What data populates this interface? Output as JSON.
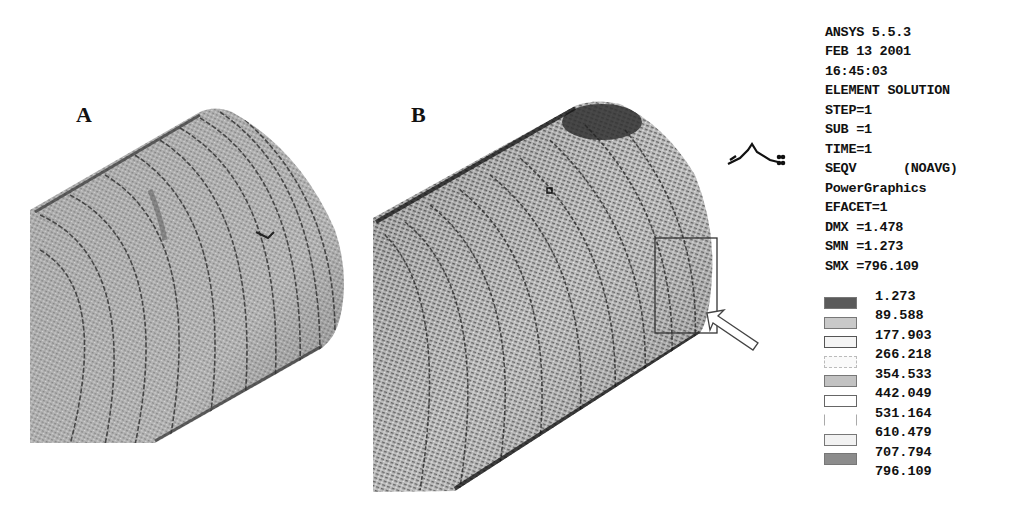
{
  "figure": {
    "panels": [
      {
        "label": "A",
        "description": "cylinder contour plot, uniform stress"
      },
      {
        "label": "B",
        "description": "cylinder contour plot with highlighted region and arrow"
      }
    ]
  },
  "legend": {
    "header_lines": [
      "ANSYS 5.5.3",
      "FEB 13 2001",
      "16:45:03",
      "ELEMENT SOLUTION",
      "STEP=1",
      "SUB =1",
      "TIME=1",
      "SEQV      (NOAVG)",
      "PowerGraphics",
      "EFACET=1",
      "DMX =1.478",
      "SMN =1.273",
      "SMX =796.109"
    ],
    "scale_values": [
      "1.273",
      "89.588",
      "177.903",
      "266.218",
      "354.533",
      "442.049",
      "531.164",
      "610.479",
      "707.794",
      "796.109"
    ],
    "swatch_colors": [
      "#5a5a5a",
      "#c9c9c9",
      "#f4f4f4",
      "#fafafa",
      "#c2c2c2",
      "#ffffff",
      "#ffffff",
      "#f2f2f2",
      "#8c8c8c"
    ]
  },
  "colors": {
    "background": "#ffffff",
    "mesh_fill_a": "#a9a9a9",
    "mesh_fill_b": "#9a9a9a",
    "contour_line": "#2a2a2a",
    "hotspot": "#3a3a3a"
  }
}
